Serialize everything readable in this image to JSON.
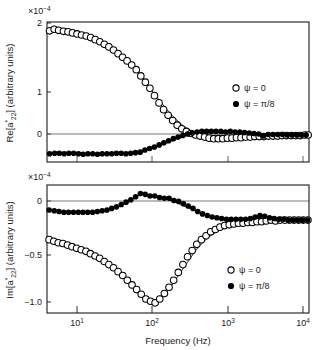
{
  "figure": {
    "background_color": "#ffffff",
    "frame_color": "#1a1a1a",
    "marker_color": "#000000",
    "curve_color": "#000000"
  },
  "xaxis": {
    "label": "Frequency (Hz)",
    "scale": "log",
    "min": 6,
    "max": 20000,
    "ticks": [
      {
        "value": 10,
        "mantissa": "10",
        "exponent": "1",
        "label": "10¹"
      },
      {
        "value": 100,
        "mantissa": "10",
        "exponent": "2",
        "label": "10²"
      },
      {
        "value": 1000,
        "mantissa": "10",
        "exponent": "3",
        "label": "10³"
      },
      {
        "value": 10000,
        "mantissa": "10",
        "exponent": "4",
        "label": "10⁴"
      }
    ]
  },
  "panels": [
    {
      "id": "real-part",
      "multiplier": "×10⁻⁴",
      "multiplier_base": "×10",
      "multiplier_exponent": "−4",
      "ylabel_prefix": "Re[a",
      "ylabel_star": "*",
      "ylabel_sub": "22",
      "ylabel_suffix": "] (arbitrary units)",
      "ylabel_full": "Re[a*22] (arbitrary units)",
      "ymin": -0.52,
      "ymax": 2.18,
      "yticks": [
        {
          "value": 0,
          "label": "0"
        },
        {
          "value": 1,
          "label": "1"
        },
        {
          "value": 2,
          "label": "2"
        }
      ],
      "zero_line": 0,
      "legend": [
        {
          "marker": "open-circle",
          "label": "ψ = 0"
        },
        {
          "marker": "filled-circle",
          "label": "ψ = π/8"
        }
      ]
    },
    {
      "id": "imaginary-part",
      "multiplier": "×10⁻⁴",
      "multiplier_base": "×10",
      "multiplier_exponent": "−4",
      "ylabel_prefix": "Im[a",
      "ylabel_star": "*",
      "ylabel_sub": "22",
      "ylabel_suffix": "] (arbitrary units)",
      "ylabel_full": "Im[a*22] (arbitrary units)",
      "ymin": -1.18,
      "ymax": 0.46,
      "yticks": [
        {
          "value": -1.0,
          "label": "−1.0"
        },
        {
          "value": -0.5,
          "label": "−0.5"
        },
        {
          "value": 0,
          "label": "0"
        }
      ],
      "zero_line": 0,
      "legend": [
        {
          "marker": "open-circle",
          "label": "ψ = 0"
        },
        {
          "marker": "filled-circle",
          "label": "ψ = π/8"
        }
      ]
    }
  ],
  "chart_data": [
    {
      "type": "scatter",
      "panel": "real-part",
      "title": "Re[a*22] (arbitrary units)",
      "xlabel": "Frequency (Hz)",
      "ylabel": "Re[a*22] (arbitrary units)",
      "y_multiplier": 0.0001,
      "xscale": "log",
      "xlim": [
        6,
        20000
      ],
      "ylim": [
        -0.52,
        2.18
      ],
      "grid": false,
      "legend_position": "right",
      "series": [
        {
          "name": "ψ = 0",
          "marker": "open-circle",
          "x": [
            6.5,
            7.5,
            8.6,
            10.0,
            11.5,
            13.2,
            15.2,
            17.5,
            20.2,
            23.2,
            26.7,
            30.8,
            35.4,
            40.8,
            47.0,
            54.1,
            62.3,
            71.7,
            82.6,
            95.1,
            109.5,
            126.1,
            145.2,
            167.2,
            192.5,
            221.7,
            255.3,
            294.0,
            338.5,
            389.8,
            448.9,
            516.9,
            595.2,
            685.4,
            789.2,
            908.8,
            1046.4,
            1205.0,
            1387.6,
            1597.9,
            1840.0,
            2118.8,
            2439.8,
            2809.4,
            3234.9,
            3724.9,
            4289.2,
            4939.0,
            5687.3,
            6549.0,
            7541.1,
            8683.5,
            9999.0,
            11514.0,
            13258.0,
            15266.0,
            17579.0,
            19500.0
          ],
          "y": [
            2.01,
            2.04,
            2.02,
            2.0,
            1.99,
            1.97,
            1.95,
            1.93,
            1.91,
            1.88,
            1.84,
            1.8,
            1.75,
            1.7,
            1.64,
            1.57,
            1.5,
            1.43,
            1.35,
            1.26,
            1.14,
            1.02,
            0.9,
            0.76,
            0.62,
            0.49,
            0.38,
            0.28,
            0.19,
            0.12,
            0.07,
            0.03,
            0.0,
            -0.02,
            -0.04,
            -0.06,
            -0.07,
            -0.07,
            -0.07,
            -0.06,
            -0.06,
            -0.05,
            -0.05,
            -0.04,
            -0.04,
            -0.03,
            -0.03,
            -0.03,
            -0.02,
            -0.02,
            -0.02,
            -0.01,
            -0.01,
            -0.01,
            -0.01,
            -0.01,
            0.0,
            0.0
          ]
        },
        {
          "name": "ψ = π/8",
          "marker": "filled-circle",
          "x": [
            6.5,
            7.6,
            8.8,
            10.2,
            11.8,
            13.7,
            15.9,
            18.4,
            21.3,
            24.7,
            28.6,
            33.1,
            38.4,
            44.5,
            51.5,
            59.7,
            69.1,
            80.0,
            92.7,
            107.3,
            124.3,
            144.0,
            166.8,
            193.2,
            223.7,
            259.1,
            300.1,
            347.6,
            402.5,
            466.2,
            539.9,
            625.3,
            724.2,
            838.8,
            971.5,
            1125.2,
            1303.2,
            1509.4,
            1748.2,
            2024.8,
            2345.1,
            2716.2,
            3146.0,
            3643.9,
            4220.5,
            4888.3,
            5661.6,
            6557.3,
            7594.7,
            8796.1,
            10187.0,
            11798.0,
            13664.0,
            15825.0,
            18327.0
          ],
          "y": [
            -0.36,
            -0.35,
            -0.35,
            -0.36,
            -0.35,
            -0.35,
            -0.36,
            -0.37,
            -0.36,
            -0.36,
            -0.37,
            -0.36,
            -0.36,
            -0.36,
            -0.35,
            -0.35,
            -0.36,
            -0.35,
            -0.34,
            -0.33,
            -0.29,
            -0.26,
            -0.23,
            -0.19,
            -0.15,
            -0.11,
            -0.07,
            -0.04,
            -0.01,
            0.02,
            0.04,
            0.06,
            0.07,
            0.07,
            0.07,
            0.07,
            0.07,
            0.06,
            0.07,
            0.06,
            0.06,
            0.05,
            0.04,
            0.03,
            0.02,
            -0.02,
            0.01,
            0.01,
            0.01,
            0.01,
            0.0,
            0.0,
            0.0,
            0.0,
            0.0
          ]
        }
      ],
      "fit_curves": [
        {
          "for_series": "ψ = 0",
          "x": [
            6,
            10,
            20,
            40,
            70,
            100,
            140,
            200,
            280,
            400,
            560,
            800,
            1100,
            1600,
            2300,
            3300,
            5000,
            8000,
            13000,
            20000
          ],
          "y": [
            2.02,
            2.0,
            1.91,
            1.71,
            1.46,
            1.21,
            0.93,
            0.65,
            0.4,
            0.19,
            0.06,
            -0.01,
            -0.05,
            -0.06,
            -0.05,
            -0.04,
            -0.03,
            -0.02,
            -0.01,
            0.0
          ]
        },
        {
          "for_series": "ψ = π/8",
          "x": [
            6,
            10,
            20,
            40,
            70,
            100,
            140,
            200,
            280,
            400,
            560,
            800,
            1100,
            1600,
            2300,
            3300,
            5000,
            8000,
            13000,
            20000
          ],
          "y": [
            -0.36,
            -0.36,
            -0.36,
            -0.36,
            -0.35,
            -0.32,
            -0.27,
            -0.2,
            -0.12,
            -0.04,
            0.02,
            0.06,
            0.07,
            0.07,
            0.06,
            0.04,
            0.02,
            0.01,
            0.01,
            0.0
          ]
        }
      ]
    },
    {
      "type": "scatter",
      "panel": "imaginary-part",
      "title": "Im[a*22] (arbitrary units)",
      "xlabel": "Frequency (Hz)",
      "ylabel": "Im[a*22] (arbitrary units)",
      "y_multiplier": 0.0001,
      "xscale": "log",
      "xlim": [
        6,
        20000
      ],
      "ylim": [
        -1.18,
        0.46
      ],
      "grid": false,
      "legend_position": "right",
      "series": [
        {
          "name": "ψ = 0",
          "marker": "open-circle",
          "x": [
            6.4,
            7.4,
            8.5,
            9.8,
            11.3,
            13.0,
            15.0,
            17.3,
            20.0,
            23.0,
            26.6,
            30.6,
            35.3,
            40.7,
            47.0,
            54.2,
            62.6,
            72.2,
            83.4,
            96.2,
            111.0,
            128.1,
            147.9,
            170.7,
            197.0,
            227.4,
            262.4,
            302.8,
            349.5,
            403.3,
            465.5,
            537.2,
            620.0,
            715.5,
            825.8,
            953.1,
            1100.0,
            1269.6,
            1465.2,
            1691.0,
            1951.6,
            2252.3,
            2599.4,
            3000.0,
            3462.3,
            3995.8,
            4611.6,
            5322.4,
            6142.9,
            7089.7,
            8182.6,
            9444.0,
            10900.0,
            12580.0,
            14520.0,
            16760.0,
            19350.0
          ],
          "y": [
            -0.24,
            -0.26,
            -0.28,
            -0.29,
            -0.31,
            -0.33,
            -0.35,
            -0.37,
            -0.39,
            -0.42,
            -0.45,
            -0.48,
            -0.52,
            -0.56,
            -0.6,
            -0.65,
            -0.7,
            -0.76,
            -0.82,
            -0.88,
            -0.94,
            -1.0,
            -1.03,
            -1.05,
            -1.0,
            -0.93,
            -0.85,
            -0.76,
            -0.66,
            -0.56,
            -0.46,
            -0.38,
            -0.3,
            -0.24,
            -0.19,
            -0.14,
            -0.11,
            -0.08,
            -0.06,
            -0.05,
            -0.04,
            -0.03,
            -0.03,
            -0.02,
            -0.02,
            -0.01,
            -0.01,
            0.0,
            0.01,
            0.0,
            0.01,
            0.01,
            0.01,
            0.01,
            0.01,
            0.01,
            0.01
          ]
        },
        {
          "name": "ψ = π/8",
          "marker": "filled-circle",
          "x": [
            6.4,
            7.5,
            8.7,
            10.1,
            11.7,
            13.6,
            15.8,
            18.3,
            21.2,
            24.6,
            28.5,
            33.1,
            38.4,
            44.5,
            51.6,
            59.9,
            69.4,
            80.5,
            93.3,
            108.2,
            125.5,
            145.5,
            168.7,
            195.6,
            226.8,
            263.0,
            305.0,
            353.6,
            410.0,
            475.4,
            551.2,
            639.1,
            741.0,
            859.2,
            996.2,
            1155.1,
            1339.3,
            1552.9,
            1800.5,
            2087.5,
            2420.3,
            2806.2,
            3253.5,
            3772.1,
            4373.3,
            5070.3,
            5878.4,
            6815.4,
            7901.9,
            9161.6,
            10622.0,
            12315.0,
            14278.0,
            16554.0,
            19192.0
          ],
          "y": [
            0.14,
            0.13,
            0.12,
            0.11,
            0.11,
            0.11,
            0.11,
            0.11,
            0.11,
            0.11,
            0.12,
            0.13,
            0.14,
            0.16,
            0.18,
            0.21,
            0.24,
            0.27,
            0.31,
            0.35,
            0.34,
            0.32,
            0.32,
            0.3,
            0.29,
            0.29,
            0.26,
            0.25,
            0.22,
            0.19,
            0.16,
            0.12,
            0.09,
            0.07,
            0.05,
            0.04,
            0.03,
            0.02,
            0.02,
            0.02,
            0.02,
            0.02,
            0.03,
            0.05,
            0.07,
            0.06,
            0.04,
            0.03,
            0.02,
            0.02,
            0.01,
            0.01,
            0.01,
            0.01,
            0.01
          ]
        }
      ],
      "fit_curves": [
        {
          "for_series": "ψ = 0",
          "x": [
            6,
            10,
            20,
            40,
            70,
            100,
            130,
            160,
            200,
            260,
            340,
            450,
            600,
            800,
            1100,
            1600,
            2300,
            3300,
            5000,
            8000,
            13000,
            20000
          ],
          "y": [
            -0.25,
            -0.29,
            -0.38,
            -0.55,
            -0.73,
            -0.89,
            -1.0,
            -1.04,
            -1.0,
            -0.88,
            -0.72,
            -0.55,
            -0.38,
            -0.25,
            -0.15,
            -0.08,
            -0.05,
            -0.03,
            -0.02,
            -0.01,
            0.0,
            0.0
          ]
        },
        {
          "for_series": "ψ = π/8",
          "x": [
            6,
            10,
            20,
            40,
            70,
            100,
            130,
            170,
            220,
            300,
            400,
            550,
            750,
            1000,
            1400,
            2000,
            3000,
            5000,
            8000,
            13000,
            20000
          ],
          "y": [
            0.13,
            0.12,
            0.11,
            0.14,
            0.23,
            0.32,
            0.34,
            0.32,
            0.29,
            0.25,
            0.2,
            0.14,
            0.09,
            0.05,
            0.03,
            0.02,
            0.02,
            0.01,
            0.01,
            0.01,
            0.0
          ]
        }
      ]
    }
  ]
}
